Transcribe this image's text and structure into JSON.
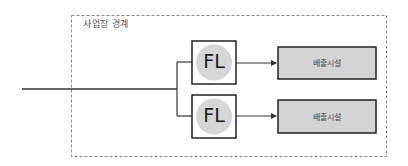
{
  "diagram": {
    "boundary": {
      "label": "사업장 경계"
    },
    "flares": [
      {
        "label": "FL"
      },
      {
        "label": "FL"
      }
    ],
    "outputs": [
      {
        "label": "배출시설"
      },
      {
        "label": "배출시설"
      }
    ],
    "colors": {
      "line": "#333333",
      "boundary_dash": "#888888",
      "circle_fill": "#d6d6d6",
      "output_fill": "#d4d4d4"
    }
  }
}
